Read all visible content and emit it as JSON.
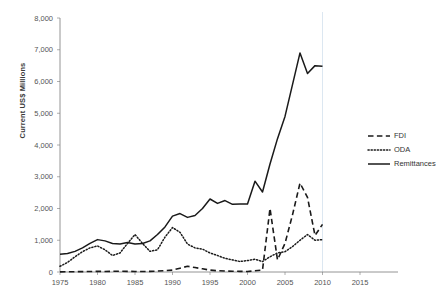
{
  "chart_data": {
    "type": "line",
    "title": "",
    "xlabel": "",
    "ylabel": "Current US$ Millions",
    "xlim": [
      1975,
      2015
    ],
    "ylim": [
      0,
      8000
    ],
    "xticks": [
      1975,
      1980,
      1985,
      1990,
      1995,
      2000,
      2005,
      2010,
      2015
    ],
    "yticks": [
      0,
      1000,
      2000,
      3000,
      4000,
      5000,
      6000,
      7000,
      8000
    ],
    "ytick_labels": [
      "0",
      "1,000",
      "2,000",
      "3,000",
      "4,000",
      "5,000",
      "6,000",
      "7,000",
      "8,000"
    ],
    "xtick_labels": [
      "1975",
      "1980",
      "1985",
      "1990",
      "1995",
      "2000",
      "2005",
      "2010",
      "2015"
    ],
    "grid": "vertical-gridline-at-2010-only",
    "legend_position": "right-middle",
    "x": [
      1975,
      1976,
      1977,
      1978,
      1979,
      1980,
      1981,
      1982,
      1983,
      1984,
      1985,
      1986,
      1987,
      1988,
      1989,
      1990,
      1991,
      1992,
      1993,
      1994,
      1995,
      1996,
      1997,
      1998,
      1999,
      2000,
      2001,
      2002,
      2003,
      2004,
      2005,
      2006,
      2007,
      2008,
      2009,
      2010
    ],
    "series": [
      {
        "name": "FDI",
        "style": "dashed",
        "values": [
          5,
          8,
          10,
          12,
          15,
          20,
          18,
          22,
          25,
          20,
          18,
          15,
          20,
          30,
          45,
          60,
          120,
          180,
          140,
          100,
          60,
          40,
          30,
          25,
          20,
          15,
          40,
          60,
          2000,
          380,
          900,
          1800,
          2800,
          2350,
          1150,
          1500
        ]
      },
      {
        "name": "ODA",
        "style": "dotted",
        "values": [
          180,
          300,
          480,
          640,
          760,
          820,
          700,
          520,
          600,
          900,
          1180,
          900,
          650,
          700,
          1100,
          1400,
          1250,
          880,
          760,
          720,
          600,
          520,
          430,
          380,
          330,
          360,
          400,
          330,
          480,
          600,
          640,
          800,
          1000,
          1180,
          1000,
          1020
        ]
      },
      {
        "name": "Remittances",
        "style": "solid",
        "values": [
          560,
          580,
          650,
          760,
          900,
          1020,
          980,
          900,
          880,
          930,
          880,
          900,
          980,
          1180,
          1420,
          1760,
          1840,
          1720,
          1780,
          2000,
          2300,
          2160,
          2250,
          2130,
          2140,
          2140,
          2860,
          2520,
          3400,
          4200,
          4900,
          5900,
          6900,
          6250,
          6500,
          6480
        ]
      }
    ]
  },
  "legend": {
    "items": [
      {
        "label": "FDI",
        "style": "dashed"
      },
      {
        "label": "ODA",
        "style": "dotted"
      },
      {
        "label": "Remittances",
        "style": "solid"
      }
    ]
  }
}
